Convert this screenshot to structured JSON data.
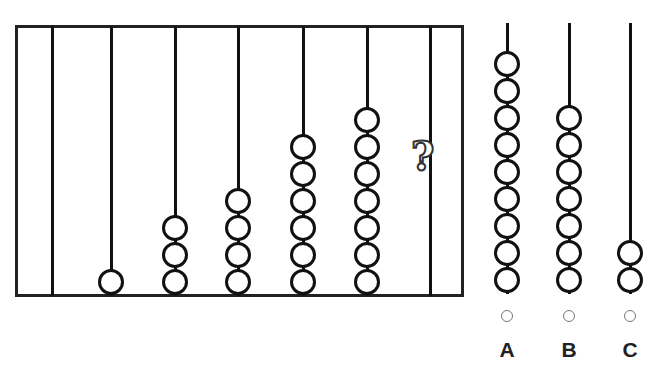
{
  "puzzle": {
    "title": "Abacus sequence puzzle",
    "sequence_bead_counts": [
      0,
      1,
      3,
      4,
      6,
      7,
      "?"
    ],
    "question_mark": "?",
    "options": [
      {
        "label": "A",
        "beads": 9
      },
      {
        "label": "B",
        "beads": 7
      },
      {
        "label": "C",
        "beads": 2
      }
    ]
  }
}
